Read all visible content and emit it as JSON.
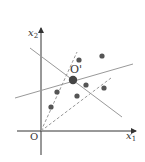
{
  "diagram": {
    "axes": {
      "origin_label": "O",
      "x_label": "x",
      "x_sub": "1",
      "y_label": "x",
      "y_sub": "2",
      "color": "#333333"
    },
    "center": {
      "label": "O'",
      "x": 73,
      "y": 80
    },
    "points": [
      {
        "x": 79,
        "y": 60
      },
      {
        "x": 102,
        "y": 56
      },
      {
        "x": 86,
        "y": 85
      },
      {
        "x": 104,
        "y": 88
      },
      {
        "x": 57,
        "y": 92
      },
      {
        "x": 77,
        "y": 96
      },
      {
        "x": 51,
        "y": 107
      }
    ],
    "solid_lines": [
      {
        "x1": 30,
        "y1": 48,
        "x2": 122,
        "y2": 117
      },
      {
        "x1": 15,
        "y1": 98,
        "x2": 133,
        "y2": 64
      }
    ],
    "dashed_lines": [
      {
        "x1": 41,
        "y1": 131,
        "x2": 77,
        "y2": 52
      },
      {
        "x1": 41,
        "y1": 131,
        "x2": 111,
        "y2": 78
      }
    ],
    "colors": {
      "point": "#555555",
      "line": "#999999",
      "axis": "#333333"
    }
  }
}
